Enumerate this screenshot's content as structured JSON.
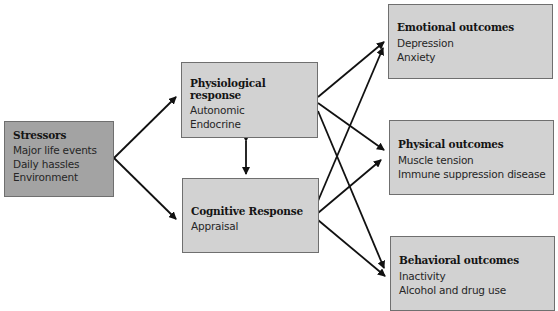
{
  "diagram": {
    "nodes": {
      "stressors": {
        "title": "Stressors",
        "items": [
          "Major life events",
          "Daily hassles",
          "Environment"
        ]
      },
      "physiological": {
        "title": "Physiological response",
        "items": [
          "Autonomic",
          "Endocrine"
        ]
      },
      "cognitive": {
        "title": "Cognitive Response",
        "items": [
          "Appraisal"
        ]
      },
      "emotional": {
        "title": "Emotional outcomes",
        "items": [
          "Depression",
          "Anxiety"
        ]
      },
      "physical": {
        "title": "Physical outcomes",
        "items": [
          "Muscle tension",
          "Immune suppression disease"
        ]
      },
      "behavioral": {
        "title": "Behavioral outcomes",
        "items": [
          "Inactivity",
          "Alcohol and drug use"
        ]
      }
    },
    "edges": [
      {
        "from": "stressors",
        "to": "physiological"
      },
      {
        "from": "stressors",
        "to": "cognitive"
      },
      {
        "from": "physiological",
        "to": "cognitive",
        "bidirectional": true
      },
      {
        "from": "physiological",
        "to": "emotional"
      },
      {
        "from": "physiological",
        "to": "physical"
      },
      {
        "from": "physiological",
        "to": "behavioral"
      },
      {
        "from": "cognitive",
        "to": "emotional"
      },
      {
        "from": "cognitive",
        "to": "physical"
      },
      {
        "from": "cognitive",
        "to": "behavioral"
      }
    ],
    "colors": {
      "stressors_fill": "#a3a3a3",
      "box_fill": "#d2d2d2",
      "border": "#6f6f6f",
      "arrow": "#111111"
    }
  }
}
